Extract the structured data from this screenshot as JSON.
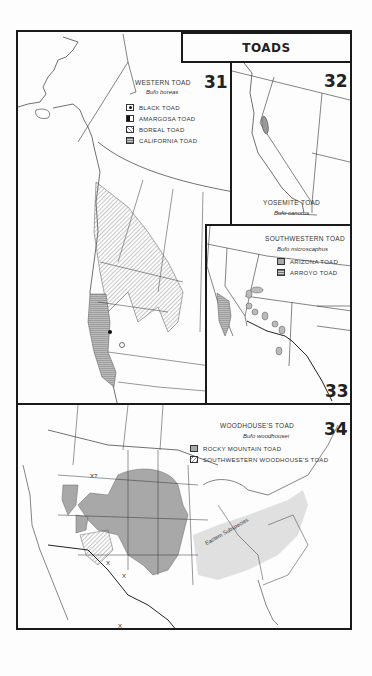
{
  "page": {
    "title": "TOADS",
    "colors": {
      "ink": "#1a1a1a",
      "paper": "#fdfdfd",
      "range_gray": "#a8a8a8",
      "light_gray": "#d0d0d0"
    }
  },
  "maps": [
    {
      "number": "31",
      "common_name": "WESTERN TOAD",
      "scientific_name": "Bufo boreas",
      "legend": [
        {
          "label": "BLACK TOAD",
          "swatch": "dot-in-square-icon"
        },
        {
          "label": "AMARGOSA TOAD",
          "swatch": "half-filled-circle-icon"
        },
        {
          "label": "BOREAL TOAD",
          "swatch": "diagonal-hatch"
        },
        {
          "label": "CALIFORNIA TOAD",
          "swatch": "cross-hatch"
        }
      ]
    },
    {
      "number": "32",
      "common_name": "YOSEMITE TOAD",
      "scientific_name": "Bufo canorus",
      "legend": []
    },
    {
      "number": "33",
      "common_name": "SOUTHWESTERN TOAD",
      "scientific_name": "Bufo microscaphus",
      "legend": [
        {
          "label": "ARIZONA TOAD",
          "swatch": "stipple"
        },
        {
          "label": "ARROYO TOAD",
          "swatch": "cross-hatch"
        }
      ]
    },
    {
      "number": "34",
      "common_name": "WOODHOUSE'S TOAD",
      "scientific_name": "Bufo woodhousei",
      "legend": [
        {
          "label": "ROCKY MOUNTAIN TOAD",
          "swatch": "stipple"
        },
        {
          "label": "SOUTHWESTERN WOODHOUSE'S TOAD",
          "swatch": "diagonal-hatch"
        }
      ],
      "annotations": {
        "subspecies_label": "Eastern Subspecies",
        "uncertain_marker": "X?",
        "isolated_marker": "X"
      }
    }
  ]
}
